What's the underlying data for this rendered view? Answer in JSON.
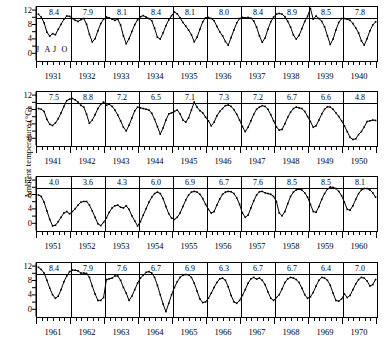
{
  "chart_data": {
    "type": "line",
    "title": "",
    "xlabel": "",
    "ylabel": "Ambient temperature (°C)",
    "ylim": [
      -2,
      13
    ],
    "ytick_labels": [
      "12",
      "8",
      "4",
      "0"
    ],
    "ytick_values": [
      12,
      8,
      4,
      0
    ],
    "yticks_minor": [
      2,
      6,
      10
    ],
    "grid": false,
    "legend": "none",
    "month_markers": [
      "J",
      "A",
      "J",
      "O"
    ],
    "month_marker_months": [
      1,
      4,
      7,
      10
    ],
    "annotation_note": "Number above each year panel is the annual mean ambient temperature in degrees Celsius",
    "rows": [
      {
        "years": [
          1931,
          1932,
          1933,
          1934,
          1935,
          1936,
          1937,
          1938,
          1939,
          1940
        ],
        "annual_means": [
          8.4,
          7.9,
          8.1,
          8.4,
          8.1,
          8.0,
          8.4,
          8.9,
          8.5,
          7.8
        ],
        "monthly": [
          [
            11.0,
            10.2,
            8.6,
            6.0,
            4.9,
            5.6,
            5.3,
            6.8,
            8.2,
            9.6,
            10.5,
            10.4
          ],
          [
            9.8,
            9.3,
            9.0,
            9.5,
            9.8,
            8.2,
            5.4,
            3.3,
            4.2,
            6.4,
            8.4,
            9.6
          ],
          [
            10.2,
            10.0,
            9.6,
            9.3,
            9.6,
            8.0,
            5.0,
            2.8,
            4.2,
            6.2,
            8.1,
            9.4
          ],
          [
            10.3,
            10.6,
            10.2,
            9.8,
            9.2,
            7.1,
            4.6,
            4.1,
            5.8,
            7.8,
            9.4,
            10.6
          ],
          [
            11.6,
            11.1,
            10.0,
            8.7,
            7.7,
            6.6,
            5.3,
            3.3,
            4.6,
            6.8,
            8.9,
            10.0
          ],
          [
            10.1,
            9.8,
            9.2,
            7.6,
            6.1,
            5.0,
            3.4,
            2.4,
            4.5,
            6.6,
            8.6,
            9.8
          ],
          [
            10.1,
            10.0,
            10.1,
            9.9,
            9.1,
            7.4,
            5.0,
            3.2,
            4.4,
            6.8,
            8.9,
            10.2
          ],
          [
            11.0,
            11.2,
            11.0,
            10.3,
            9.0,
            7.4,
            5.2,
            4.1,
            5.1,
            7.0,
            9.0,
            10.4
          ],
          [
            12.6,
            9.6,
            10.5,
            9.8,
            9.0,
            7.5,
            5.0,
            2.6,
            4.1,
            6.6,
            8.7,
            9.8
          ],
          [
            9.8,
            9.6,
            9.3,
            8.4,
            7.2,
            5.8,
            3.6,
            2.4,
            4.2,
            6.4,
            8.0,
            8.9
          ]
        ]
      },
      {
        "years": [
          1941,
          1942,
          1943,
          1944,
          1945,
          1946,
          1947,
          1948,
          1949,
          1950
        ],
        "annual_means": [
          7.5,
          8.8,
          7.2,
          6.5,
          7.1,
          7.3,
          7.2,
          6.7,
          6.6,
          4.8
        ],
        "monthly": [
          [
            8.4,
            8.2,
            7.6,
            5.4,
            4.0,
            3.7,
            4.4,
            5.6,
            7.2,
            9.0,
            10.6,
            11.0
          ],
          [
            11.2,
            10.8,
            10.2,
            9.3,
            8.8,
            6.8,
            4.3,
            5.2,
            6.7,
            8.4,
            9.6,
            10.2
          ],
          [
            9.3,
            9.6,
            9.0,
            8.0,
            6.6,
            5.0,
            3.2,
            2.2,
            3.8,
            5.8,
            7.8,
            8.8
          ],
          [
            8.6,
            8.4,
            8.2,
            8.0,
            7.1,
            5.4,
            3.4,
            1.3,
            3.0,
            5.2,
            6.9,
            7.2
          ],
          [
            7.6,
            8.0,
            6.9,
            5.2,
            4.6,
            5.8,
            8.0,
            10.2,
            8.8,
            7.8,
            7.2,
            6.0
          ],
          [
            5.0,
            3.6,
            4.6,
            6.4,
            7.6,
            8.4,
            9.2,
            9.4,
            9.0,
            8.1,
            6.8,
            5.2
          ],
          [
            3.4,
            2.0,
            3.2,
            5.0,
            6.8,
            8.2,
            8.8,
            9.2,
            9.0,
            8.2,
            6.7,
            5.0
          ],
          [
            3.3,
            2.4,
            2.6,
            4.2,
            6.0,
            7.4,
            8.4,
            8.8,
            8.6,
            8.4,
            7.6,
            6.2
          ],
          [
            4.8,
            3.2,
            3.6,
            5.2,
            6.9,
            8.2,
            8.9,
            8.8,
            8.2,
            7.2,
            6.2,
            5.0
          ],
          [
            3.6,
            2.0,
            0.4,
            -0.2,
            0.0,
            1.2,
            2.0,
            3.3,
            4.8,
            5.0,
            5.2,
            5.1
          ]
        ]
      },
      {
        "years": [
          1951,
          1952,
          1953,
          1954,
          1955,
          1956,
          1957,
          1958,
          1959,
          1960
        ],
        "annual_means": [
          4.0,
          3.6,
          4.3,
          6.0,
          6.9,
          6.7,
          7.6,
          8.5,
          8.5,
          8.1
        ],
        "monthly": [
          [
            8.0,
            7.6,
            6.0,
            3.6,
            1.2,
            -0.6,
            -0.4,
            0.6,
            1.8,
            3.0,
            3.4,
            2.8
          ],
          [
            3.4,
            4.2,
            5.2,
            6.0,
            6.2,
            6.2,
            5.2,
            3.6,
            1.8,
            0.0,
            -0.5,
            0.4
          ],
          [
            1.6,
            3.2,
            4.4,
            5.0,
            5.2,
            4.6,
            4.4,
            5.0,
            4.0,
            2.2,
            0.8,
            -0.6
          ],
          [
            0.6,
            2.4,
            4.2,
            6.0,
            7.4,
            8.4,
            8.8,
            8.4,
            7.0,
            4.8,
            2.8,
            1.6
          ],
          [
            1.2,
            1.8,
            3.0,
            4.8,
            6.6,
            8.0,
            8.8,
            9.0,
            8.8,
            8.2,
            7.0,
            5.4
          ],
          [
            4.0,
            3.0,
            3.4,
            5.2,
            6.9,
            8.2,
            8.8,
            9.0,
            8.9,
            8.4,
            7.2,
            5.4
          ],
          [
            3.0,
            1.8,
            2.4,
            4.4,
            6.4,
            8.0,
            8.9,
            9.0,
            8.6,
            8.4,
            8.2,
            7.6
          ],
          [
            6.2,
            3.0,
            2.2,
            3.4,
            5.6,
            7.6,
            8.8,
            9.4,
            9.6,
            9.4,
            8.6,
            7.4
          ],
          [
            5.4,
            3.4,
            3.2,
            4.8,
            6.8,
            8.4,
            9.6,
            10.2,
            10.1,
            9.8,
            9.0,
            7.8
          ],
          [
            6.0,
            4.0,
            3.8,
            5.0,
            6.8,
            8.4,
            9.4,
            9.8,
            9.8,
            9.4,
            8.6,
            7.4
          ]
        ]
      },
      {
        "years": [
          1961,
          1962,
          1963,
          1964,
          1965,
          1966,
          1967,
          1968,
          1969,
          1970
        ],
        "annual_means": [
          8.4,
          7.9,
          7.6,
          6.7,
          6.9,
          6.3,
          6.7,
          6.7,
          6.4,
          7.0
        ],
        "monthly": [
          [
            11.8,
            11.2,
            10.2,
            8.2,
            6.0,
            4.2,
            3.2,
            3.8,
            5.6,
            7.8,
            9.4,
            10.6
          ],
          [
            11.0,
            11.0,
            10.8,
            10.2,
            10.2,
            10.1,
            9.0,
            6.6,
            4.4,
            2.6,
            2.6,
            3.4
          ],
          [
            8.4,
            8.6,
            8.8,
            9.4,
            9.4,
            8.2,
            6.2,
            4.6,
            2.6,
            3.8,
            5.6,
            7.4
          ],
          [
            8.8,
            9.6,
            10.4,
            10.6,
            10.2,
            9.0,
            6.8,
            4.2,
            1.6,
            -0.5,
            1.8,
            4.2
          ],
          [
            6.2,
            7.8,
            9.0,
            9.6,
            9.8,
            9.7,
            9.0,
            7.4,
            5.2,
            3.0,
            2.0,
            2.2
          ],
          [
            3.2,
            4.6,
            6.2,
            7.6,
            8.6,
            8.8,
            8.2,
            6.4,
            4.0,
            2.2,
            1.8,
            2.6
          ],
          [
            4.0,
            5.6,
            7.4,
            8.6,
            9.0,
            8.5,
            8.8,
            8.2,
            7.0,
            5.0,
            3.2,
            2.6
          ],
          [
            3.4,
            4.2,
            5.8,
            7.6,
            8.6,
            9.0,
            8.8,
            8.4,
            7.6,
            6.0,
            4.2,
            3.2
          ],
          [
            3.6,
            4.8,
            6.6,
            8.2,
            9.0,
            8.8,
            8.2,
            6.8,
            4.6,
            2.6,
            2.4,
            3.0
          ],
          [
            4.4,
            3.4,
            4.0,
            5.6,
            7.2,
            8.4,
            9.0,
            8.8,
            8.0,
            6.6,
            7.0,
            8.4
          ]
        ]
      }
    ]
  }
}
